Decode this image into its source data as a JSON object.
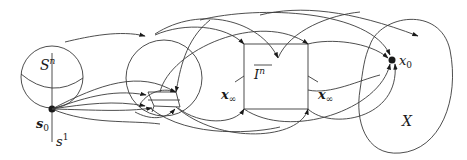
{
  "diagram": {
    "kind": "topological mapping diagram",
    "labels": {
      "sphere": "S",
      "sphere_sup": "n",
      "base_point": "s",
      "base_point_sub": "0",
      "circle": "s",
      "circle_sup": "1",
      "cube": "I",
      "cube_sup": "n",
      "x_inf_left": "x",
      "x_inf_left_sub": "∞",
      "x_inf_right": "x",
      "x_inf_right_sub": "∞",
      "target_point": "x",
      "target_point_sub": "0",
      "space": "X"
    },
    "nodes": [
      {
        "id": "sphere",
        "label": "S^n",
        "shape": "sphere"
      },
      {
        "id": "s0",
        "label": "s_0",
        "shape": "point"
      },
      {
        "id": "middle-disk",
        "label": "",
        "shape": "circle with inscribed polygon"
      },
      {
        "id": "cube",
        "label": "overline I^n",
        "shape": "square"
      },
      {
        "id": "X",
        "label": "X",
        "shape": "blob"
      },
      {
        "id": "x0",
        "label": "x_0",
        "shape": "point"
      }
    ],
    "colors": {
      "stroke": "#3a3a3a",
      "text": "#1a1a1a",
      "background": "#ffffff"
    }
  }
}
